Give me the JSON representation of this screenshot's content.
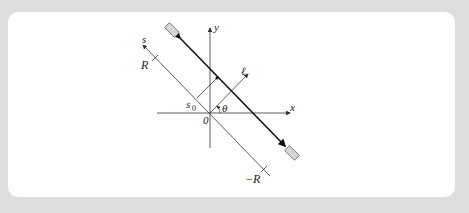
{
  "figure": {
    "labels": {
      "x_axis": "x",
      "y_axis": "y",
      "s_axis": "s",
      "t_axis": "ℓ",
      "angle": "θ",
      "origin": "0",
      "offset": "s",
      "offset_sub": "0",
      "r_pos": "R",
      "r_neg": "−R"
    },
    "colors": {
      "background": "#dddddd",
      "panel": "#ffffff",
      "line": "#333333",
      "beam": "#111111",
      "detector_fill": "#d6d6d6"
    }
  }
}
